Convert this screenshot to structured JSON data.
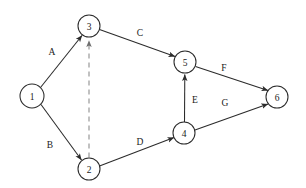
{
  "diagram": {
    "type": "activity-on-arrow-network",
    "background_color": "#ffffff",
    "line_color": "#2b2b2b",
    "dummy_line_color": "#8a8a8a",
    "node_fill": "#ffffff",
    "nodes": [
      {
        "id": "1",
        "label": "1",
        "cx": 32,
        "cy": 96,
        "r": 12
      },
      {
        "id": "2",
        "label": "2",
        "cx": 89,
        "cy": 169,
        "r": 11
      },
      {
        "id": "3",
        "label": "3",
        "cx": 89,
        "cy": 26,
        "r": 11
      },
      {
        "id": "4",
        "label": "4",
        "cx": 184,
        "cy": 133,
        "r": 11
      },
      {
        "id": "5",
        "label": "5",
        "cx": 185,
        "cy": 62,
        "r": 11
      },
      {
        "id": "6",
        "label": "6",
        "cx": 277,
        "cy": 97,
        "r": 11
      }
    ],
    "edges": [
      {
        "id": "A",
        "label": "A",
        "from": "1",
        "to": "3",
        "style": "solid",
        "arrow": true,
        "label_x": 52,
        "label_y": 52
      },
      {
        "id": "B",
        "label": "B",
        "from": "1",
        "to": "2",
        "style": "solid",
        "arrow": true,
        "label_x": 50,
        "label_y": 145
      },
      {
        "id": "C",
        "label": "C",
        "from": "3",
        "to": "5",
        "style": "solid",
        "arrow": true,
        "label_x": 140,
        "label_y": 33
      },
      {
        "id": "D",
        "label": "D",
        "from": "2",
        "to": "4",
        "style": "solid",
        "arrow": true,
        "label_x": 140,
        "label_y": 142
      },
      {
        "id": "E",
        "label": "E",
        "from": "4",
        "to": "5",
        "style": "solid",
        "arrow": true,
        "label_x": 195,
        "label_y": 100
      },
      {
        "id": "F",
        "label": "F",
        "from": "5",
        "to": "6",
        "style": "solid",
        "arrow": true,
        "label_x": 224,
        "label_y": 68
      },
      {
        "id": "G",
        "label": "G",
        "from": "4",
        "to": "6",
        "style": "solid",
        "arrow": true,
        "label_x": 225,
        "label_y": 103
      },
      {
        "id": "dummy",
        "label": "",
        "from": "2",
        "to": "3",
        "style": "dashed",
        "arrow": true,
        "label_x": 0,
        "label_y": 0
      }
    ]
  }
}
